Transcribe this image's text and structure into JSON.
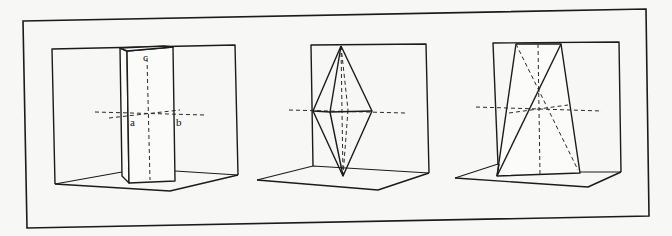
{
  "figure": {
    "panels": [
      {
        "id": "panel-1",
        "shape": "rectangular prism",
        "axis_labels": {
          "a": "a",
          "b": "b",
          "c": "c"
        }
      },
      {
        "id": "panel-2",
        "shape": "bipyramid"
      },
      {
        "id": "panel-3",
        "shape": "trapezoidal slab with diagonals"
      }
    ],
    "colors": {
      "line": "#1b1b1b",
      "background": "#f7f7f5"
    }
  }
}
